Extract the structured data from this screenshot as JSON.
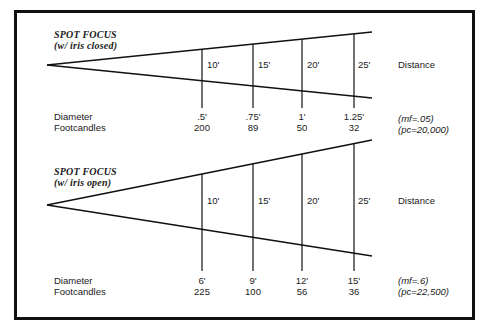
{
  "diagrams": [
    {
      "title": "SPOT FOCUS",
      "subtitle": "(w/ iris closed)",
      "row_labels": {
        "diameter": "Diameter",
        "footcandles": "Footcandles"
      },
      "distance_label": "Distance",
      "distances": [
        "10'",
        "15'",
        "20'",
        "25'"
      ],
      "diameters": [
        ".5'",
        ".75'",
        "1'",
        "1.25'"
      ],
      "footcandles": [
        "200",
        "89",
        "50",
        "32"
      ],
      "mf": "(mf=.05)",
      "pc": "(pc=20,000)"
    },
    {
      "title": "SPOT FOCUS",
      "subtitle": "(w/ iris open)",
      "row_labels": {
        "diameter": "Diameter",
        "footcandles": "Footcandles"
      },
      "distance_label": "Distance",
      "distances": [
        "10'",
        "15'",
        "20'",
        "25'"
      ],
      "diameters": [
        "6'",
        "9'",
        "12'",
        "15'"
      ],
      "footcandles": [
        "225",
        "100",
        "56",
        "36"
      ],
      "mf": "(mf=.6)",
      "pc": "(pc=22,500)"
    }
  ],
  "colors": {
    "ink": "#111111",
    "background": "#ffffff"
  }
}
